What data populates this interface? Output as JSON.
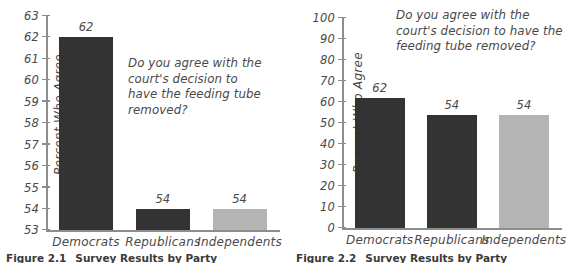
{
  "figures": [
    {
      "caption_number": "Figure 2.1",
      "caption_title": "Survey Results by Party",
      "chart_data": {
        "type": "bar",
        "title": "",
        "annotation": "Do you agree with the court's decision to have the feeding tube removed?",
        "categories": [
          "Democrats",
          "Republicans",
          "Independents"
        ],
        "values": [
          62,
          54,
          54
        ],
        "value_labels": [
          "62",
          "54",
          "54"
        ],
        "bar_colors": [
          "#333333",
          "#333333",
          "#b4b4b4"
        ],
        "xlabel": "",
        "ylabel": "Percent Who Agree",
        "ylim": [
          53,
          63
        ],
        "yticks": [
          53,
          54,
          55,
          56,
          57,
          58,
          59,
          60,
          61,
          62,
          63
        ],
        "ytick_labels": [
          "53",
          "54",
          "55",
          "56",
          "57",
          "58",
          "59",
          "60",
          "61",
          "62",
          "63"
        ],
        "grid": false,
        "legend": "none"
      }
    },
    {
      "caption_number": "Figure 2.2",
      "caption_title": "Survey Results by Party",
      "chart_data": {
        "type": "bar",
        "title": "",
        "annotation": "Do you agree with the court's decision to have the feeding tube removed?",
        "categories": [
          "Democrats",
          "Republicans",
          "Independents"
        ],
        "values": [
          62,
          54,
          54
        ],
        "value_labels": [
          "62",
          "54",
          "54"
        ],
        "bar_colors": [
          "#333333",
          "#333333",
          "#b4b4b4"
        ],
        "xlabel": "",
        "ylabel": "Percent Who Agree",
        "ylim": [
          0,
          100
        ],
        "yticks": [
          0,
          10,
          20,
          30,
          40,
          50,
          60,
          70,
          80,
          90,
          100
        ],
        "ytick_labels": [
          "0",
          "10",
          "20",
          "30",
          "40",
          "50",
          "60",
          "70",
          "80",
          "90",
          "100"
        ],
        "grid": false,
        "legend": "none"
      }
    }
  ]
}
